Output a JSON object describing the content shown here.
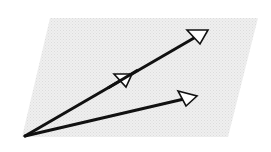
{
  "diagram": {
    "type": "vector-diagram",
    "colors": {
      "background": "#ffffff",
      "plane_fill": "#ebebeb",
      "vector_stroke": "#111111",
      "arrowhead_fill": "#ffffff"
    },
    "plane": {
      "shape": "parallelogram",
      "points": [
        [
          50,
          18
        ],
        [
          258,
          18
        ],
        [
          228,
          137
        ],
        [
          22,
          137
        ]
      ]
    },
    "origin": [
      25,
      136
    ],
    "vectors": [
      {
        "name": "long-vector",
        "start": [
          25,
          136
        ],
        "end": [
          194,
          38
        ],
        "arrowhead": [
          [
            187,
            30
          ],
          [
            208,
            30
          ],
          [
            200,
            44
          ]
        ],
        "mid_marker": [
          [
            114,
            74
          ],
          [
            132,
            74
          ],
          [
            126,
            87
          ]
        ]
      },
      {
        "name": "short-vector",
        "start": [
          25,
          136
        ],
        "end": [
          184,
          99
        ],
        "arrowhead": [
          [
            178,
            91
          ],
          [
            197,
            96
          ],
          [
            186,
            106
          ]
        ]
      }
    ]
  }
}
